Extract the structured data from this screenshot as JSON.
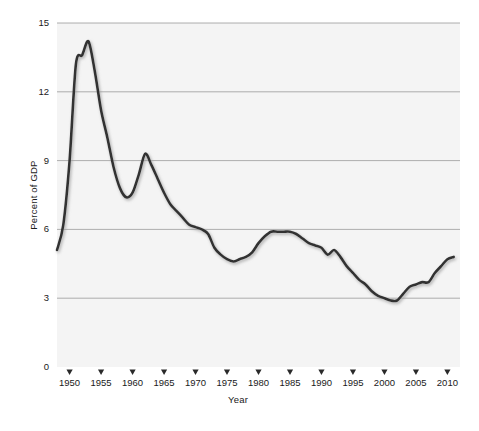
{
  "chart_data": {
    "type": "line",
    "title": "",
    "xlabel": "Year",
    "ylabel": "Percent of GDP",
    "xlim": [
      1948,
      2012
    ],
    "ylim": [
      0,
      15
    ],
    "grid": true,
    "legend": "none",
    "yticks": [
      0,
      3,
      6,
      9,
      12,
      15
    ],
    "ytick_labels": [
      "0",
      "3",
      "6",
      "9",
      "12",
      "15"
    ],
    "xticks": [
      1950,
      1955,
      1960,
      1965,
      1970,
      1975,
      1980,
      1985,
      1990,
      1995,
      2000,
      2005,
      2010
    ],
    "xtick_labels": [
      "1950",
      "1955",
      "1960",
      "1965",
      "1970",
      "1975",
      "1980",
      "1985",
      "1990",
      "1995",
      "2000",
      "2005",
      "2010"
    ],
    "series": [
      {
        "name": "Percent of GDP",
        "color": "#333333",
        "x": [
          1948,
          1949,
          1950,
          1951,
          1952,
          1953,
          1954,
          1955,
          1956,
          1957,
          1958,
          1959,
          1960,
          1961,
          1962,
          1963,
          1964,
          1965,
          1966,
          1967,
          1968,
          1969,
          1970,
          1971,
          1972,
          1973,
          1974,
          1975,
          1976,
          1977,
          1978,
          1979,
          1980,
          1981,
          1982,
          1983,
          1984,
          1985,
          1986,
          1987,
          1988,
          1989,
          1990,
          1991,
          1992,
          1993,
          1994,
          1995,
          1996,
          1997,
          1998,
          1999,
          2000,
          2001,
          2002,
          2003,
          2004,
          2005,
          2006,
          2007,
          2008,
          2009,
          2010,
          2011
        ],
        "values": [
          5.1,
          6.2,
          9.0,
          13.2,
          13.6,
          14.2,
          12.9,
          11.2,
          10.0,
          8.7,
          7.8,
          7.4,
          7.6,
          8.4,
          9.3,
          8.8,
          8.2,
          7.6,
          7.1,
          6.8,
          6.5,
          6.2,
          6.1,
          6.0,
          5.8,
          5.2,
          4.9,
          4.7,
          4.6,
          4.7,
          4.8,
          5.0,
          5.4,
          5.7,
          5.9,
          5.9,
          5.9,
          5.9,
          5.8,
          5.6,
          5.4,
          5.3,
          5.2,
          4.9,
          5.1,
          4.8,
          4.4,
          4.1,
          3.8,
          3.6,
          3.3,
          3.1,
          3.0,
          2.9,
          2.9,
          3.2,
          3.5,
          3.6,
          3.7,
          3.7,
          4.1,
          4.4,
          4.7,
          4.8
        ]
      }
    ]
  },
  "axis": {
    "x_title": "Year",
    "y_title": "Percent of GDP"
  }
}
